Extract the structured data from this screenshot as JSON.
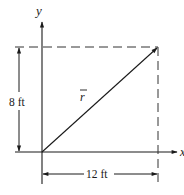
{
  "diagram": {
    "type": "position-vector-rectangle",
    "axes": {
      "x_label": "x",
      "y_label": "y"
    },
    "vector": {
      "label": "r",
      "overbar": true,
      "from": "origin",
      "to": "top-right corner"
    },
    "dimensions": {
      "vertical": {
        "value": "8 ft"
      },
      "horizontal": {
        "value": "12 ft"
      }
    },
    "colors": {
      "line": "#1a1a1a",
      "dashed": "#333333",
      "background": "#ffffff"
    }
  }
}
